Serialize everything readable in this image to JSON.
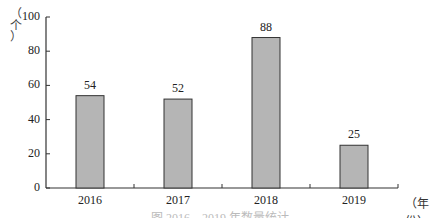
{
  "chart_data": {
    "type": "bar",
    "title": "",
    "categories": [
      "2016",
      "2017",
      "2018",
      "2019"
    ],
    "values": [
      54,
      52,
      88,
      25
    ],
    "data_labels": [
      "54",
      "52",
      "88",
      "25"
    ],
    "xlabel": "（年份）",
    "ylabel": "（个）",
    "ylim": [
      0,
      100
    ],
    "yticks": [
      "0",
      "20",
      "40",
      "60",
      "80",
      "100"
    ],
    "grid": false,
    "legend": null,
    "bar_color": "#b5b5b5",
    "bar_edge_color": "#333333"
  },
  "axis": {
    "y_label_chars": [
      "（",
      "个",
      "）"
    ],
    "x_unit": "（年份）"
  },
  "caption": "图 2016—2019 年数量统计"
}
